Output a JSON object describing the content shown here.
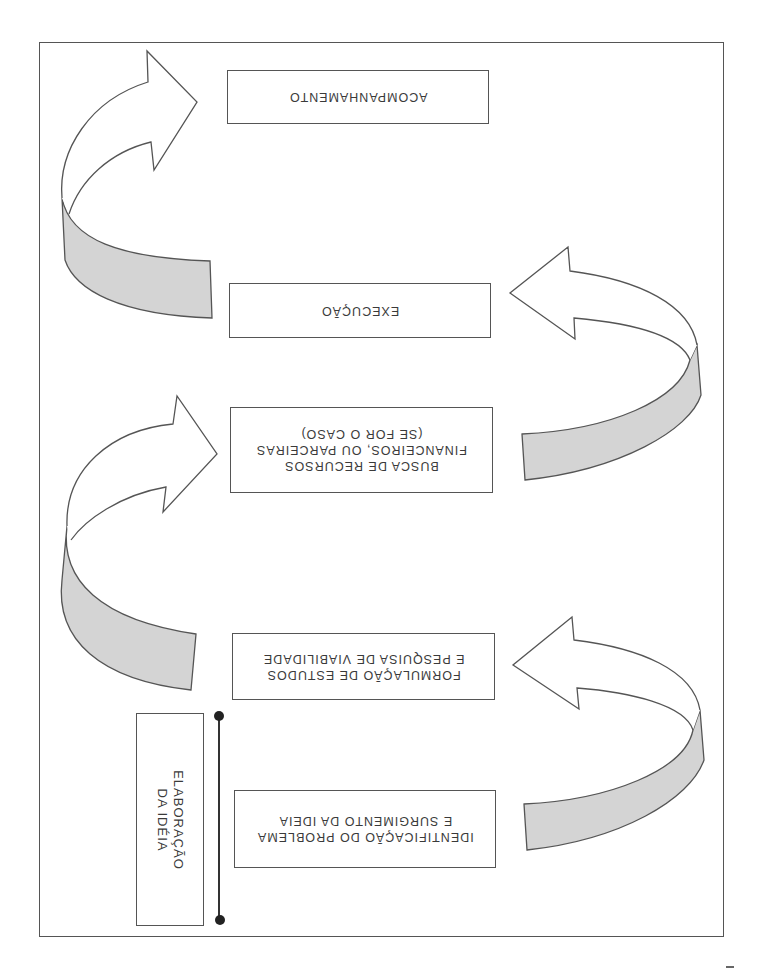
{
  "diagram": {
    "type": "process-flow",
    "orientation": "rotated-180",
    "steps": [
      {
        "id": 1,
        "label": "IDENTIFICAÇÃO DO PROBLEMA\nE SURGIMENTO DA IDEIA"
      },
      {
        "id": 2,
        "label": "FORMULAÇÃO DE ESTUDOS\nE PESQUISA DE VIABILIDADE"
      },
      {
        "id": 3,
        "label": "BUSCA DE RECURSOS\nFINANCEIROS, OU PARCEIRAS\n(SE FOR O CASO)"
      },
      {
        "id": 4,
        "label": "EXECUÇÃO"
      },
      {
        "id": 5,
        "label": "ACOMPANHAMENTO"
      }
    ],
    "phase": {
      "label": "ELABORAÇÃO\nDA IDÉIA",
      "spans_steps": [
        1,
        2
      ]
    },
    "arrows": [
      {
        "from": 1,
        "to": 2,
        "side": "right",
        "icon": "curved-arrow-icon"
      },
      {
        "from": 2,
        "to": 3,
        "side": "left",
        "icon": "curved-arrow-icon"
      },
      {
        "from": 3,
        "to": 4,
        "side": "right",
        "icon": "curved-arrow-icon"
      },
      {
        "from": 4,
        "to": 5,
        "side": "left",
        "icon": "curved-arrow-icon"
      }
    ],
    "colors": {
      "stroke": "#555555",
      "ribbon_fill": "#d4d4d4",
      "text": "#3a3a3a",
      "dot": "#222222"
    }
  }
}
